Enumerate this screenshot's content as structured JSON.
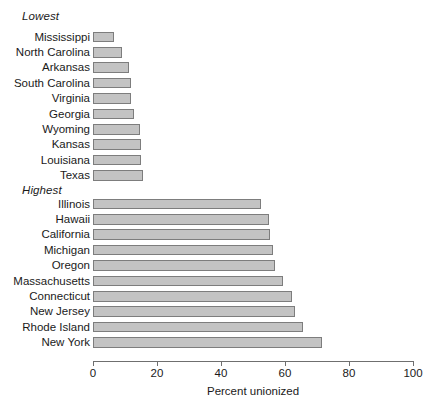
{
  "chart_data": {
    "type": "bar",
    "orientation": "horizontal",
    "title": "",
    "xlabel": "Percent unionized",
    "ylabel": "",
    "xlim": [
      0,
      100
    ],
    "xticks": [
      0,
      20,
      40,
      60,
      80,
      100
    ],
    "xtick_labels": [
      "0",
      "20",
      "40",
      "60",
      "80",
      "100"
    ],
    "grid": false,
    "legend": null,
    "bar_fill_color": "#c3c3c3",
    "bar_border_color": "#7d7d7d",
    "axis_color": "#6f6f6f",
    "groups": [
      {
        "name": "Lowest",
        "label": "Lowest",
        "categories": [
          "Mississippi",
          "North Carolina",
          "Arkansas",
          "South Carolina",
          "Virginia",
          "Georgia",
          "Wyoming",
          "Kansas",
          "Louisiana",
          "Texas"
        ],
        "values": [
          6.6,
          9.0,
          11.4,
          11.8,
          11.9,
          12.8,
          14.6,
          15.0,
          15.1,
          15.6
        ]
      },
      {
        "name": "Highest",
        "label": "Highest",
        "categories": [
          "Illinois",
          "Hawaii",
          "California",
          "Michigan",
          "Oregon",
          "Massachusetts",
          "Connecticut",
          "New Jersey",
          "Rhode Island",
          "New York"
        ],
        "values": [
          52.5,
          55.0,
          55.3,
          56.3,
          57.0,
          59.4,
          62.2,
          63.0,
          65.6,
          71.6
        ]
      }
    ]
  }
}
